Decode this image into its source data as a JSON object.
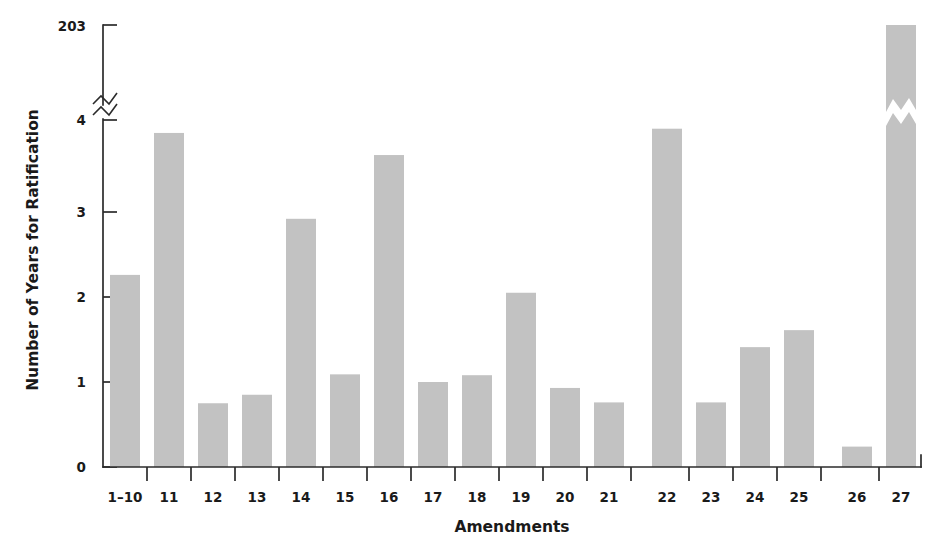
{
  "chart_data": {
    "type": "bar",
    "title": "",
    "xlabel": "Amendments",
    "ylabel": "Number of Years for Ratification",
    "categories": [
      "1–10",
      "11",
      "12",
      "13",
      "14",
      "15",
      "16",
      "17",
      "18",
      "19",
      "20",
      "21",
      "22",
      "23",
      "24",
      "25",
      "26",
      "27"
    ],
    "values": [
      2.26,
      3.93,
      0.75,
      0.85,
      2.92,
      1.09,
      3.67,
      1.0,
      1.08,
      2.05,
      0.93,
      0.76,
      3.98,
      0.76,
      1.41,
      1.61,
      0.24,
      203
    ],
    "ytick_labels": [
      "0",
      "1",
      "2",
      "3",
      "4",
      "203"
    ],
    "ytick_values": [
      0,
      1,
      2,
      3,
      4,
      203
    ],
    "ylim": [
      0,
      4
    ],
    "axis_break": true,
    "axis_break_label_below": "4",
    "axis_break_label_above": "203",
    "grid": false,
    "legend": "none",
    "bar_color": "#c2c2c2",
    "axis_color": "#2b2b2b",
    "text_color": "#1a1a1a",
    "series": [
      {
        "name": "Number of Years for Ratification",
        "values": [
          2.26,
          3.93,
          0.75,
          0.85,
          2.92,
          1.09,
          3.67,
          1.0,
          1.08,
          2.05,
          0.93,
          0.76,
          3.98,
          0.76,
          1.41,
          1.61,
          0.24,
          203
        ]
      }
    ]
  },
  "axis": {
    "y_title": "Number of Years for Ratification",
    "x_title": "Amendments",
    "y_tick_0": "0",
    "y_tick_1": "1",
    "y_tick_2": "2",
    "y_tick_3": "3",
    "y_tick_4": "4",
    "y_tick_top": "203"
  },
  "xticks": {
    "t0": "1–10",
    "t1": "11",
    "t2": "12",
    "t3": "13",
    "t4": "14",
    "t5": "15",
    "t6": "16",
    "t7": "17",
    "t8": "18",
    "t9": "19",
    "t10": "20",
    "t11": "21",
    "t12": "22",
    "t13": "23",
    "t14": "24",
    "t15": "25",
    "t16": "26",
    "t17": "27"
  }
}
